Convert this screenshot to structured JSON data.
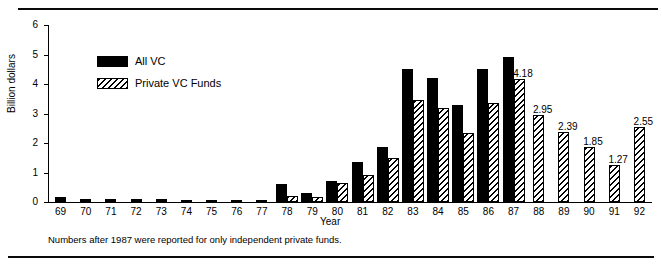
{
  "figure": {
    "ylabel": "Billion dollars",
    "xlabel": "Year",
    "footnote": "Numbers after 1987 were reported for only independent private funds."
  },
  "legend": {
    "items": [
      {
        "label": "All VC",
        "swatch": "solid-black"
      },
      {
        "label": "Private VC Funds",
        "swatch": "diagonal-hatch"
      }
    ]
  },
  "chart_data": {
    "type": "bar",
    "title": "",
    "xlabel": "Year",
    "ylabel": "Billion dollars",
    "ylim": [
      0,
      6
    ],
    "yticks": [
      0,
      1,
      2,
      3,
      4,
      5,
      6
    ],
    "grid": false,
    "legend_position": "upper-left-inside",
    "annotation": "Numbers after 1987 were reported for only independent private funds.",
    "categories": [
      "69",
      "70",
      "71",
      "72",
      "73",
      "74",
      "75",
      "76",
      "77",
      "78",
      "79",
      "80",
      "81",
      "82",
      "83",
      "84",
      "85",
      "86",
      "87",
      "88",
      "89",
      "90",
      "91",
      "92"
    ],
    "series": [
      {
        "name": "All VC",
        "style": "solid-black",
        "values": [
          0.17,
          0.1,
          0.09,
          0.09,
          0.1,
          0.07,
          0.08,
          0.08,
          0.07,
          0.6,
          0.32,
          0.72,
          1.35,
          1.85,
          4.5,
          4.2,
          3.3,
          4.5,
          4.9,
          null,
          null,
          null,
          null,
          null
        ]
      },
      {
        "name": "Private VC Funds",
        "style": "diagonal-hatch",
        "values": [
          null,
          null,
          null,
          null,
          null,
          null,
          null,
          null,
          null,
          0.21,
          0.16,
          0.65,
          0.9,
          1.5,
          3.45,
          3.2,
          2.35,
          3.35,
          4.18,
          2.95,
          2.39,
          1.85,
          1.27,
          2.55
        ]
      }
    ],
    "value_labels": {
      "87": "4.18",
      "88": "2.95",
      "89": "2.39",
      "90": "1.85",
      "91": "1.27",
      "92": "2.55"
    }
  }
}
